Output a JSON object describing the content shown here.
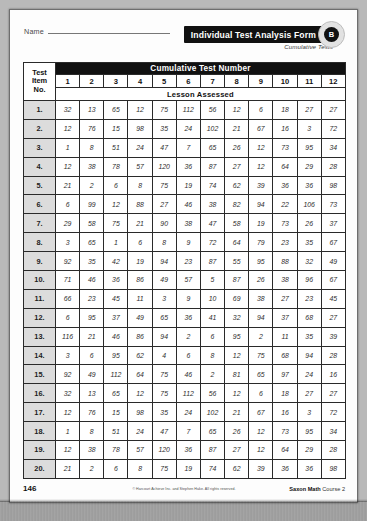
{
  "header": {
    "name_label": "Name",
    "title": "Individual Test Analysis Form",
    "form_badge": "B",
    "subtitle": "Cumulative Tests"
  },
  "table": {
    "item_header_lines": [
      "Test",
      "Item",
      "No."
    ],
    "group_header": "Cumulative Test Number",
    "columns": [
      "1",
      "2",
      "3",
      "4",
      "5",
      "6",
      "7",
      "8",
      "9",
      "10",
      "11",
      "12"
    ],
    "subheader": "Lesson Assessed",
    "rows": [
      {
        "label": "1.",
        "values": [
          "32",
          "13",
          "65",
          "12",
          "75",
          "112",
          "56",
          "12",
          "6",
          "18",
          "27",
          "27"
        ]
      },
      {
        "label": "2.",
        "values": [
          "12",
          "76",
          "15",
          "98",
          "35",
          "24",
          "102",
          "21",
          "67",
          "16",
          "3",
          "72"
        ]
      },
      {
        "label": "3.",
        "values": [
          "1",
          "8",
          "51",
          "24",
          "47",
          "7",
          "65",
          "26",
          "12",
          "73",
          "95",
          "34"
        ]
      },
      {
        "label": "4.",
        "values": [
          "12",
          "38",
          "78",
          "57",
          "120",
          "36",
          "87",
          "27",
          "12",
          "64",
          "29",
          "28"
        ]
      },
      {
        "label": "5.",
        "values": [
          "21",
          "2",
          "6",
          "8",
          "75",
          "19",
          "74",
          "62",
          "39",
          "36",
          "36",
          "98"
        ]
      },
      {
        "label": "6.",
        "values": [
          "6",
          "99",
          "12",
          "88",
          "27",
          "46",
          "38",
          "82",
          "94",
          "22",
          "106",
          "73"
        ]
      },
      {
        "label": "7.",
        "values": [
          "29",
          "58",
          "75",
          "21",
          "90",
          "38",
          "47",
          "58",
          "19",
          "73",
          "26",
          "37"
        ]
      },
      {
        "label": "8.",
        "values": [
          "3",
          "65",
          "1",
          "6",
          "8",
          "9",
          "72",
          "64",
          "79",
          "23",
          "35",
          "67"
        ]
      },
      {
        "label": "9.",
        "values": [
          "92",
          "35",
          "42",
          "19",
          "94",
          "23",
          "87",
          "55",
          "95",
          "88",
          "32",
          "49"
        ]
      },
      {
        "label": "10.",
        "values": [
          "71",
          "46",
          "36",
          "86",
          "49",
          "57",
          "5",
          "87",
          "26",
          "38",
          "96",
          "67"
        ]
      },
      {
        "label": "11.",
        "values": [
          "66",
          "23",
          "45",
          "11",
          "3",
          "9",
          "10",
          "69",
          "38",
          "27",
          "23",
          "45"
        ]
      },
      {
        "label": "12.",
        "values": [
          "6",
          "95",
          "37",
          "49",
          "65",
          "36",
          "41",
          "32",
          "94",
          "37",
          "68",
          "27"
        ]
      },
      {
        "label": "13.",
        "values": [
          "116",
          "21",
          "46",
          "86",
          "94",
          "2",
          "6",
          "95",
          "2",
          "11",
          "35",
          "39"
        ]
      },
      {
        "label": "14.",
        "values": [
          "3",
          "6",
          "95",
          "62",
          "4",
          "6",
          "8",
          "12",
          "75",
          "68",
          "94",
          "28"
        ]
      },
      {
        "label": "15.",
        "values": [
          "92",
          "49",
          "112",
          "64",
          "75",
          "46",
          "2",
          "81",
          "65",
          "97",
          "24",
          "16"
        ]
      },
      {
        "label": "16.",
        "values": [
          "32",
          "13",
          "65",
          "12",
          "75",
          "112",
          "56",
          "12",
          "6",
          "18",
          "27",
          "27"
        ]
      },
      {
        "label": "17.",
        "values": [
          "12",
          "76",
          "15",
          "98",
          "35",
          "24",
          "102",
          "21",
          "67",
          "16",
          "3",
          "72"
        ]
      },
      {
        "label": "18.",
        "values": [
          "1",
          "8",
          "51",
          "24",
          "47",
          "7",
          "65",
          "26",
          "12",
          "73",
          "95",
          "34"
        ]
      },
      {
        "label": "19.",
        "values": [
          "12",
          "38",
          "78",
          "57",
          "120",
          "36",
          "87",
          "27",
          "12",
          "64",
          "29",
          "28"
        ]
      },
      {
        "label": "20.",
        "values": [
          "21",
          "2",
          "6",
          "8",
          "75",
          "19",
          "74",
          "62",
          "39",
          "36",
          "36",
          "98"
        ]
      }
    ]
  },
  "footer": {
    "page_number": "146",
    "copyright": "© Harcourt Achieve Inc. and Stephen Hake. All rights reserved.",
    "brand": "Saxon Math",
    "course": "Course 2"
  },
  "colors": {
    "header_bar": "#111111",
    "row_label_fill": "#dcdcdc",
    "grid_line": "#2a2a2a",
    "page": "#fdfdfd"
  }
}
